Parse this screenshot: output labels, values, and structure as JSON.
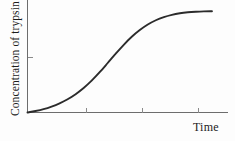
{
  "chart_data": {
    "type": "line",
    "title": "",
    "subtitle": "",
    "xlabel": "Time",
    "ylabel": "Concentration of trypsin",
    "grid": false,
    "legend": null,
    "legend_position": "none",
    "annotations": [],
    "xlim": [
      0,
      1
    ],
    "ylim": [
      0,
      1
    ],
    "xticks": [
      0.295,
      0.572,
      0.85
    ],
    "xtick_labels": [
      "",
      "",
      ""
    ],
    "yticks": [
      0.49
    ],
    "ytick_labels": [
      ""
    ],
    "series": [
      {
        "name": "Concentration of trypsin",
        "color": "#2b2b2b",
        "x": [
          0.0,
          0.04,
          0.08,
          0.12,
          0.16,
          0.2,
          0.24,
          0.28,
          0.32,
          0.36,
          0.4,
          0.44,
          0.48,
          0.52,
          0.56,
          0.6,
          0.64,
          0.68,
          0.72,
          0.76,
          0.8,
          0.84,
          0.88,
          0.92
        ],
        "y": [
          0.0,
          0.013,
          0.03,
          0.053,
          0.082,
          0.118,
          0.163,
          0.218,
          0.283,
          0.358,
          0.44,
          0.523,
          0.602,
          0.673,
          0.733,
          0.782,
          0.82,
          0.848,
          0.868,
          0.882,
          0.891,
          0.896,
          0.899,
          0.9
        ]
      }
    ]
  },
  "axes": {
    "y_axis_name": "y-axis",
    "x_axis_name": "x-axis"
  }
}
